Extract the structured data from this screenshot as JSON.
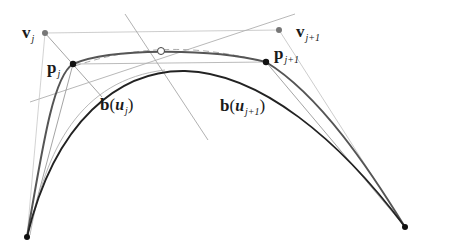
{
  "diagram": {
    "labels": {
      "v_j": {
        "base": "v",
        "sub": "j"
      },
      "v_j1": {
        "base": "v",
        "sub": "j+1"
      },
      "p_j": {
        "base": "p",
        "sub": "j"
      },
      "p_j1": {
        "base": "p",
        "sub": "j+1"
      },
      "b_uj": {
        "fn": "b",
        "open": "(",
        "var": "u",
        "sub": "j",
        "close": ")"
      },
      "b_uj1": {
        "fn": "b",
        "open": "(",
        "var": "u",
        "sub": "j+1",
        "close": ")"
      }
    },
    "points": {
      "v_j": [
        45,
        33
      ],
      "v_j1": [
        279,
        30
      ],
      "p_j": [
        73,
        64
      ],
      "p_j1": [
        266,
        62
      ],
      "midpoint_open": [
        161,
        51
      ],
      "end_left": [
        27,
        237
      ],
      "end_right": [
        405,
        227
      ]
    },
    "colors": {
      "curve_dark": "#222222",
      "curve_mid": "#555555",
      "line_light": "#bbbbbb",
      "line_mid": "#999999",
      "point_dark": "#111111",
      "point_gray": "#777777"
    }
  }
}
